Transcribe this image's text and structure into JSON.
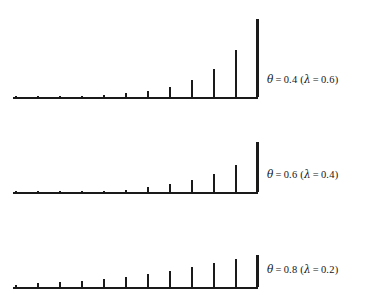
{
  "figure": {
    "type": "stem-plot-figure",
    "background_color": "#ffffff",
    "line_color": "#1a1a1a",
    "panel_count": 3
  },
  "panels": [
    {
      "id": "panel-theta-0.4",
      "label_full": "θ = 0.4 (λ = 0.6)",
      "theta_symbol": "θ",
      "theta_value": "0.4",
      "lambda_symbol": "λ",
      "lambda_value": "0.6",
      "equals": "=",
      "paren_open": "(",
      "paren_close": ")"
    },
    {
      "id": "panel-theta-0.6",
      "label_full": "θ = 0.6 (λ = 0.4)",
      "theta_symbol": "θ",
      "theta_value": "0.6",
      "lambda_symbol": "λ",
      "lambda_value": "0.4",
      "equals": "=",
      "paren_open": "(",
      "paren_close": ")"
    },
    {
      "id": "panel-theta-0.8",
      "label_full": "θ = 0.8 (λ = 0.2)",
      "theta_symbol": "θ",
      "theta_value": "0.8",
      "lambda_symbol": "λ",
      "lambda_value": "0.2",
      "equals": "=",
      "paren_open": "(",
      "paren_close": ")"
    }
  ],
  "chart_data": [
    {
      "type": "bar",
      "title": "θ = 0.4 (λ = 0.6)",
      "xlabel": "",
      "ylabel": "",
      "grid": false,
      "legend": "none",
      "categories": [
        "0",
        "1",
        "2",
        "3",
        "4",
        "5",
        "6",
        "7",
        "8",
        "9",
        "10",
        "11"
      ],
      "x": [
        0,
        1,
        2,
        3,
        4,
        5,
        6,
        7,
        8,
        9,
        10,
        11
      ],
      "values": [
        0.0036,
        0.006,
        0.01,
        0.0167,
        0.0278,
        0.0464,
        0.0773,
        0.1289,
        0.2149,
        0.3581,
        0.5968,
        1.0
      ],
      "ylim": [
        0,
        1
      ],
      "xlim": [
        0,
        11
      ],
      "note": "relative stem heights, rightmost stem = 1.0"
    },
    {
      "type": "bar",
      "title": "θ = 0.6 (λ = 0.4)",
      "xlabel": "",
      "ylabel": "",
      "grid": false,
      "legend": "none",
      "categories": [
        "0",
        "1",
        "2",
        "3",
        "4",
        "5",
        "6",
        "7",
        "8",
        "9",
        "10",
        "11"
      ],
      "x": [
        0,
        1,
        2,
        3,
        4,
        5,
        6,
        7,
        8,
        9,
        10,
        11
      ],
      "values": [
        0.0004,
        0.001,
        0.0026,
        0.0064,
        0.016,
        0.04,
        0.1,
        0.16,
        0.24,
        0.36,
        0.54,
        1.0
      ],
      "ylim": [
        0,
        1
      ],
      "xlim": [
        0,
        11
      ],
      "note": "relative stem heights, rightmost stem = 1.0"
    },
    {
      "type": "bar",
      "title": "θ = 0.8 (λ = 0.2)",
      "xlabel": "",
      "ylabel": "",
      "grid": false,
      "legend": "none",
      "categories": [
        "0",
        "1",
        "2",
        "3",
        "4",
        "5",
        "6",
        "7",
        "8",
        "9",
        "10",
        "11"
      ],
      "x": [
        0,
        1,
        2,
        3,
        4,
        5,
        6,
        7,
        8,
        9,
        10,
        11
      ],
      "values": [
        0.06,
        0.11,
        0.15,
        0.2,
        0.26,
        0.32,
        0.41,
        0.51,
        0.63,
        0.75,
        0.86,
        1.0
      ],
      "ylim": [
        0,
        1
      ],
      "xlim": [
        0,
        11
      ],
      "note": "relative stem heights, rightmost stem = 1.0"
    }
  ],
  "geometry": {
    "axis_x_start": 13,
    "axis_x_end": 258,
    "stem_x_positions": [
      15,
      37,
      59,
      81,
      103,
      125,
      147,
      169,
      191,
      213,
      235,
      256
    ],
    "panel_baselines": [
      98,
      193,
      287
    ],
    "panel_max_heights": [
      78,
      50,
      32
    ],
    "label_x": 267,
    "label_y": [
      75,
      170,
      266
    ]
  }
}
